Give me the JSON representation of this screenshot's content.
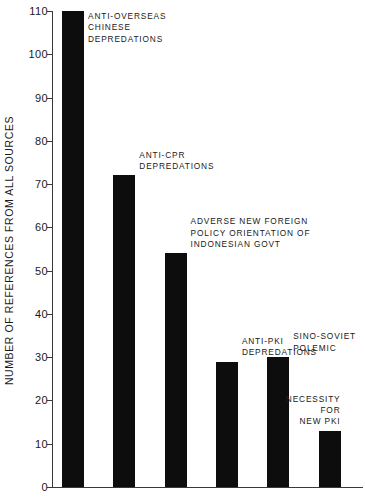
{
  "chart_data": {
    "type": "bar",
    "title": "",
    "xlabel": "",
    "ylabel": "NUMBER OF REFERENCES FROM ALL SOURCES",
    "ylim": [
      0,
      110
    ],
    "ytick_step": 10,
    "yticks": [
      0,
      10,
      20,
      30,
      40,
      50,
      60,
      70,
      80,
      90,
      100,
      110
    ],
    "ytick_labels": [
      "0",
      "10",
      "20",
      "30",
      "40",
      "50",
      "60",
      "70",
      "80",
      "90",
      "100",
      "110"
    ],
    "grid": false,
    "legend": null,
    "xtick_labels": [],
    "bar_color": "#0d0d0d",
    "axis_color": "#3a3a3a",
    "categories": [
      "ANTI-OVERSEAS CHINESE DEPREDATIONS",
      "ANTI-CPR DEPREDATIONS",
      "ADVERSE NEW FOREIGN POLICY ORIENTATION OF INDONESIAN GOVT",
      "ANTI-PKI DEPREDATIONS",
      "SINO-SOVIET POLEMIC",
      "NECESSITY FOR NEW PKI"
    ],
    "values": [
      110,
      72,
      54,
      29,
      30,
      13
    ],
    "annotations": [
      {
        "bar_index": 0,
        "lines": [
          "ANTI-OVERSEAS",
          "CHINESE",
          "DEPREDATIONS"
        ],
        "align": "left"
      },
      {
        "bar_index": 1,
        "lines": [
          "ANTI-CPR",
          "DEPREDATIONS"
        ],
        "align": "left"
      },
      {
        "bar_index": 2,
        "lines": [
          "ADVERSE NEW FOREIGN",
          "POLICY ORIENTATION OF",
          "INDONESIAN GOVT"
        ],
        "align": "left"
      },
      {
        "bar_index": 3,
        "lines": [
          "ANTI-PKI",
          "DEPREDATIONS"
        ],
        "align": "left"
      },
      {
        "bar_index": 4,
        "lines": [
          "SINO-SOVIET",
          "POLEMIC"
        ],
        "align": "left"
      },
      {
        "bar_index": 5,
        "lines": [
          "NECESSITY",
          "FOR",
          "NEW PKI"
        ],
        "align": "right"
      }
    ]
  }
}
